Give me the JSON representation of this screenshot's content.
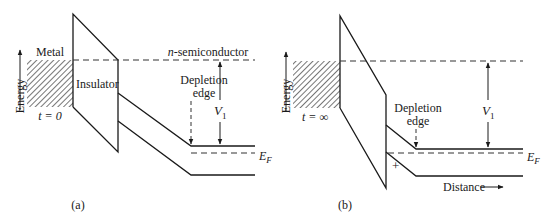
{
  "figure": {
    "panels": [
      {
        "id": "a",
        "caption": "(a)",
        "labels": {
          "metal": "Metal",
          "insulator": "Insulator",
          "semiconductor": "n-semiconductor",
          "semiconductor_prefix": "n",
          "semiconductor_suffix": "-semiconductor",
          "energy_axis": "Energy",
          "time": "t = 0",
          "depletion_line1": "Depletion",
          "depletion_line2": "edge",
          "voltage": "V",
          "voltage_sub": "1",
          "fermi": "E",
          "fermi_sub": "F"
        }
      },
      {
        "id": "b",
        "caption": "(b)",
        "labels": {
          "energy_axis": "Energy",
          "time": "t = ∞",
          "depletion_line1": "Depletion",
          "depletion_line2": "edge",
          "voltage": "V",
          "voltage_sub": "1",
          "fermi": "E",
          "fermi_sub": "F",
          "charge": "+",
          "distance_axis": "Distance"
        }
      }
    ],
    "colors": {
      "ink": "#1a1a1a",
      "background": "#ffffff"
    }
  }
}
